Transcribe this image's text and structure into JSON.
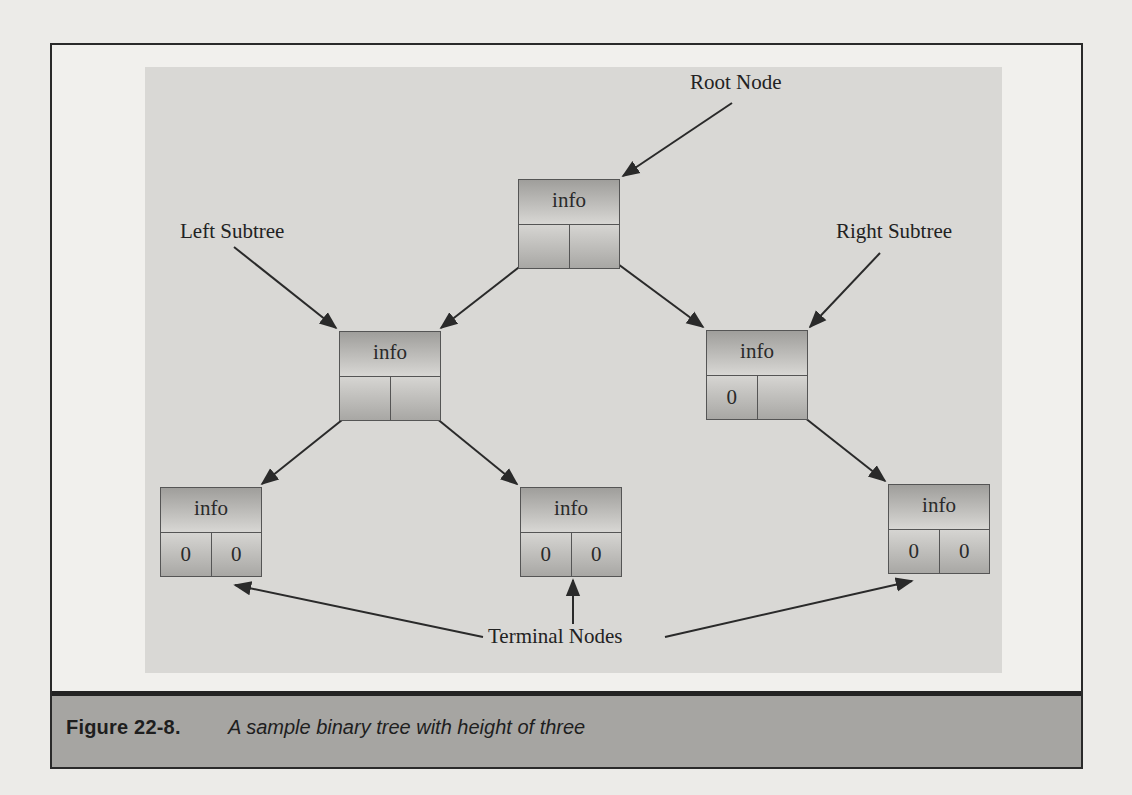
{
  "figure": {
    "number_label": "Figure 22-8.",
    "caption": "A sample binary tree with height of three"
  },
  "labels": {
    "root": "Root Node",
    "left_subtree": "Left Subtree",
    "right_subtree": "Right Subtree",
    "terminal": "Terminal Nodes"
  },
  "nodes": [
    {
      "id": "root",
      "info": "info",
      "left": "",
      "right": "",
      "x": 518,
      "y": 179
    },
    {
      "id": "left",
      "info": "info",
      "left": "",
      "right": "",
      "x": 339,
      "y": 331
    },
    {
      "id": "right",
      "info": "info",
      "left": "0",
      "right": "",
      "x": 706,
      "y": 330
    },
    {
      "id": "left-left",
      "info": "info",
      "left": "0",
      "right": "0",
      "x": 160,
      "y": 487
    },
    {
      "id": "left-right",
      "info": "info",
      "left": "0",
      "right": "0",
      "x": 520,
      "y": 487
    },
    {
      "id": "right-right",
      "info": "info",
      "left": "0",
      "right": "0",
      "x": 888,
      "y": 484
    }
  ],
  "colors": {
    "page": "#ecebe8",
    "panel": "#d9d8d5",
    "caption_band": "#a6a5a2",
    "ink": "#222222"
  }
}
